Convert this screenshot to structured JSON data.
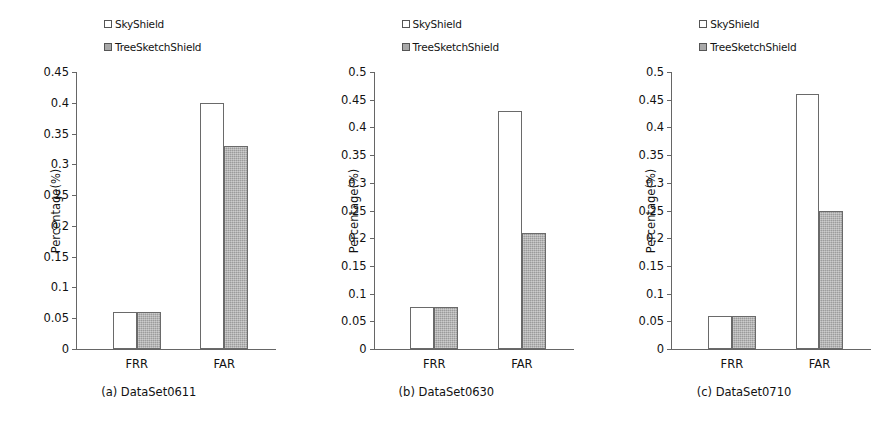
{
  "figure": {
    "panels": [
      {
        "caption": "(a)  DataSet0611",
        "ylabel": "Percentage(%)",
        "ticks": [
          "0.45",
          "0.4",
          "0.35",
          "0.3",
          "0.25",
          "0.2",
          "0.15",
          "0.1",
          "0.05",
          "0"
        ],
        "categories": [
          "FRR",
          "FAR"
        ],
        "legend": [
          {
            "name": "SkyShield",
            "swatch": "legend-swatch-open-square"
          },
          {
            "name": "TreeSketchShield",
            "swatch": "legend-swatch-gray-square"
          }
        ]
      },
      {
        "caption": "(b)  DataSet0630",
        "ylabel": "Percentage(%)",
        "ticks": [
          "0.5",
          "0.45",
          "0.4",
          "0.35",
          "0.3",
          "0.25",
          "0.2",
          "0.15",
          "0.1",
          "0.05",
          "0"
        ],
        "categories": [
          "FRR",
          "FAR"
        ],
        "legend": [
          {
            "name": "SkyShield",
            "swatch": "legend-swatch-open-square"
          },
          {
            "name": "TreeSketchShield",
            "swatch": "legend-swatch-gray-square"
          }
        ]
      },
      {
        "caption": "(c)  DataSet0710",
        "ylabel": "Percentage(%)",
        "ticks": [
          "0.5",
          "0.45",
          "0.4",
          "0.35",
          "0.3",
          "0.25",
          "0.2",
          "0.15",
          "0.1",
          "0.05",
          "0"
        ],
        "categories": [
          "FRR",
          "FAR"
        ],
        "legend": [
          {
            "name": "SkyShield",
            "swatch": "legend-swatch-open-square"
          },
          {
            "name": "TreeSketchShield",
            "swatch": "legend-swatch-gray-square"
          }
        ]
      }
    ]
  },
  "chart_data": [
    {
      "type": "bar",
      "title": "(a)  DataSet0611",
      "categories": [
        "FRR",
        "FAR"
      ],
      "series": [
        {
          "name": "SkyShield",
          "values": [
            0.06,
            0.4
          ]
        },
        {
          "name": "TreeSketchShield",
          "values": [
            0.06,
            0.33
          ]
        }
      ],
      "xlabel": "",
      "ylabel": "Percentage(%)",
      "ylim": [
        0,
        0.45
      ],
      "ytick_step": 0.05,
      "grid": false,
      "legend_position": "top-center"
    },
    {
      "type": "bar",
      "title": "(b)  DataSet0630",
      "categories": [
        "FRR",
        "FAR"
      ],
      "series": [
        {
          "name": "SkyShield",
          "values": [
            0.075,
            0.43
          ]
        },
        {
          "name": "TreeSketchShield",
          "values": [
            0.075,
            0.21
          ]
        }
      ],
      "xlabel": "",
      "ylabel": "Percentage(%)",
      "ylim": [
        0,
        0.5
      ],
      "ytick_step": 0.05,
      "grid": false,
      "legend_position": "top-center"
    },
    {
      "type": "bar",
      "title": "(c)  DataSet0710",
      "categories": [
        "FRR",
        "FAR"
      ],
      "series": [
        {
          "name": "SkyShield",
          "values": [
            0.06,
            0.46
          ]
        },
        {
          "name": "TreeSketchShield",
          "values": [
            0.06,
            0.25
          ]
        }
      ],
      "xlabel": "",
      "ylabel": "Percentage(%)",
      "ylim": [
        0,
        0.5
      ],
      "ytick_step": 0.05,
      "grid": false,
      "legend_position": "top-center"
    }
  ],
  "colors": {
    "series_skyshield_fill": "#ffffff",
    "series_treesketchshield_fill": "#aaaaaa",
    "bar_outline": "#6a6a6a",
    "axis": "#666666",
    "text": "#111111",
    "background": "#ffffff"
  }
}
